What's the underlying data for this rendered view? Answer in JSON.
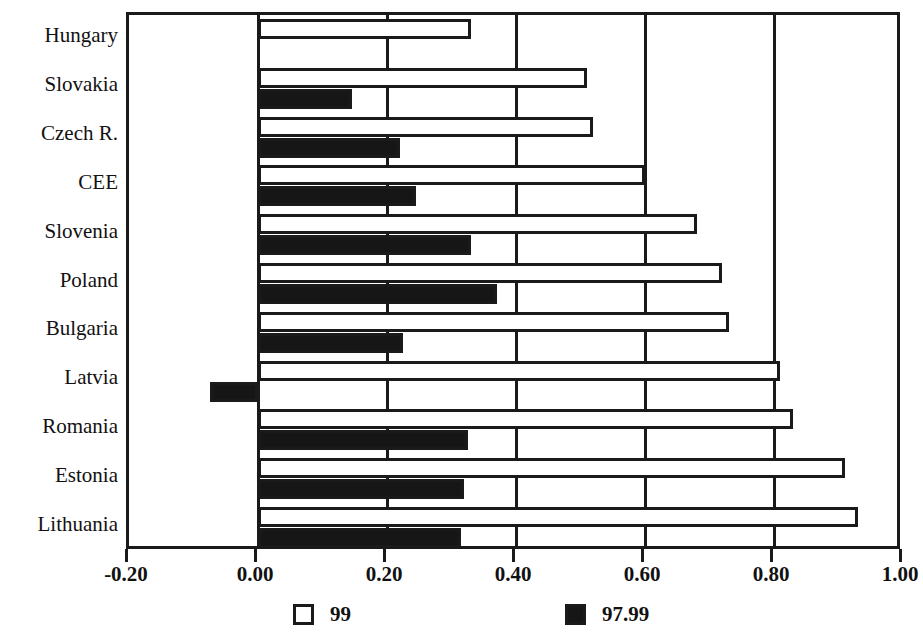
{
  "chart_data": {
    "type": "bar",
    "orientation": "horizontal",
    "title": "",
    "xlabel": "",
    "ylabel": "",
    "xlim": [
      -0.2,
      1.0
    ],
    "xticks": [
      "-0.20",
      "0.00",
      "0.20",
      "0.40",
      "0.60",
      "0.80",
      "1.00"
    ],
    "xtick_values": [
      -0.2,
      0.0,
      0.2,
      0.4,
      0.6,
      0.8,
      1.0
    ],
    "grid": true,
    "legend_position": "bottom",
    "categories": [
      "Hungary",
      "Slovakia",
      "Czech R.",
      "CEE",
      "Slovenia",
      "Poland",
      "Bulgaria",
      "Latvia",
      "Romania",
      "Estonia",
      "Lithuania"
    ],
    "series": [
      {
        "name": "99",
        "color": "#ffffff",
        "values": [
          0.33,
          0.51,
          0.52,
          0.6,
          0.68,
          0.72,
          0.73,
          0.81,
          0.83,
          0.91,
          0.93
        ]
      },
      {
        "name": "97.99",
        "color": "#161616",
        "values": [
          0.0,
          0.145,
          0.22,
          0.245,
          0.33,
          0.37,
          0.225,
          -0.075,
          0.325,
          0.32,
          0.315
        ]
      }
    ]
  },
  "legend": {
    "entries": [
      {
        "label": "99",
        "swatch": "white-square"
      },
      {
        "label": "97.99",
        "swatch": "black-square"
      }
    ]
  }
}
